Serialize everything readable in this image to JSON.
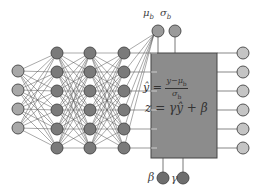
{
  "diagram": {
    "colors": {
      "background": "#ffffff",
      "input_node": "#a8a8a8",
      "hidden_node": "#7a7a7a",
      "stat_node": "#9a9a9a",
      "param_node": "#6e6e6e",
      "output_node": "#c4c4c4",
      "node_stroke": "#444444",
      "edge": "#555555",
      "bn_box_fill": "#8c8c8c",
      "bn_box_stroke": "#444444"
    },
    "layers": [
      {
        "name": "input",
        "x": 18,
        "ys": [
          71,
          90,
          109,
          128
        ]
      },
      {
        "name": "hidden-1",
        "x": 57,
        "ys": [
          53,
          72,
          91,
          110,
          129,
          148
        ]
      },
      {
        "name": "hidden-2",
        "x": 90,
        "ys": [
          53,
          72,
          91,
          110,
          129,
          148
        ]
      },
      {
        "name": "hidden-3",
        "x": 124,
        "ys": [
          53,
          72,
          91,
          110,
          129,
          148
        ]
      }
    ],
    "stat_nodes": [
      {
        "name": "mu",
        "label": "μ",
        "sub": "b",
        "x": 158,
        "y": 31
      },
      {
        "name": "sigma",
        "label": "σ",
        "sub": "b",
        "x": 175,
        "y": 31
      }
    ],
    "param_nodes": [
      {
        "name": "beta",
        "label": "β",
        "x": 163,
        "y": 178
      },
      {
        "name": "gamma",
        "label": "γ",
        "x": 183,
        "y": 178
      }
    ],
    "bn_box": {
      "x": 151,
      "y": 53,
      "w": 66,
      "h": 105
    },
    "outputs": {
      "x": 243,
      "ys": [
        53,
        72,
        91,
        110,
        129,
        148
      ]
    },
    "node_radius": 6,
    "formulas": {
      "normalize_lhs": "ŷ",
      "equals": "=",
      "normalize_num": "y−μ",
      "normalize_num_sub": "b",
      "normalize_den": "σ",
      "normalize_den_sub": "b",
      "scale_shift": "z = γŷ + β"
    },
    "labels": {
      "mu": "μ",
      "mu_sub": "b",
      "sigma": "σ",
      "sigma_sub": "b",
      "beta": "β",
      "gamma": "γ"
    }
  }
}
